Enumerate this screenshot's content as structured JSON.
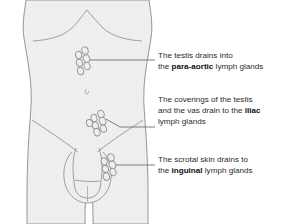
{
  "figure": {
    "colors": {
      "background": "#ffffff",
      "skin_fill": "#f0f0f0",
      "outline": "#8a8a8a",
      "node_outline": "#9a9a9a",
      "node_fill": "#efefef",
      "leader_line": "#6e6e6e",
      "text": "#2b2b2b",
      "text_bold": "#111111"
    }
  },
  "callouts": [
    {
      "id": "para-aortic",
      "target": "para-aortic-node-cluster",
      "lines": [
        {
          "text": "The testis drains into",
          "bold": ""
        },
        {
          "pre": "the ",
          "bold": "para-aortic",
          "post": " lymph glands"
        }
      ]
    },
    {
      "id": "iliac",
      "target": "iliac-node-cluster",
      "lines": [
        {
          "text": "The coverings of the testis",
          "bold": ""
        },
        {
          "pre": "and the vas drain to the ",
          "bold": "iliac",
          "post": ""
        },
        {
          "text": "lymph glands",
          "bold": ""
        }
      ]
    },
    {
      "id": "inguinal",
      "target": "inguinal-node-cluster",
      "lines": [
        {
          "text": "The scrotal skin drains to",
          "bold": ""
        },
        {
          "pre": "the ",
          "bold": "inguinal",
          "post": " lymph glands"
        }
      ]
    }
  ],
  "node_clusters": [
    {
      "name": "para-aortic-node-cluster",
      "label": "para-aortic lymph glands",
      "count": 6,
      "nodes": [
        {
          "cx": 85.0,
          "cy": 50.5,
          "rx": 3.1,
          "ry": 3.8,
          "rot": -18
        },
        {
          "cx": 78.6,
          "cy": 55.0,
          "rx": 3.0,
          "ry": 3.7,
          "rot": -12
        },
        {
          "cx": 86.4,
          "cy": 58.6,
          "rx": 3.2,
          "ry": 3.9,
          "rot": -20
        },
        {
          "cx": 79.4,
          "cy": 62.8,
          "rx": 3.0,
          "ry": 3.6,
          "rot": -15
        },
        {
          "cx": 87.0,
          "cy": 66.0,
          "rx": 3.0,
          "ry": 3.7,
          "rot": -22
        },
        {
          "cx": 80.6,
          "cy": 71.0,
          "rx": 3.1,
          "ry": 3.8,
          "rot": -14
        }
      ]
    },
    {
      "name": "iliac-node-cluster",
      "label": "iliac lymph glands",
      "count": 7,
      "nodes": [
        {
          "cx": 101.0,
          "cy": 114.0,
          "rx": 3.1,
          "ry": 3.8,
          "rot": -20
        },
        {
          "cx": 94.0,
          "cy": 118.0,
          "rx": 3.0,
          "ry": 3.7,
          "rot": -14
        },
        {
          "cx": 102.6,
          "cy": 121.2,
          "rx": 3.2,
          "ry": 3.9,
          "rot": -24
        },
        {
          "cx": 95.4,
          "cy": 125.6,
          "rx": 3.0,
          "ry": 3.6,
          "rot": -16
        },
        {
          "cx": 103.4,
          "cy": 128.6,
          "rx": 3.0,
          "ry": 3.7,
          "rot": -20
        },
        {
          "cx": 89.4,
          "cy": 123.0,
          "rx": 3.0,
          "ry": 3.6,
          "rot": -12
        },
        {
          "cx": 97.0,
          "cy": 132.2,
          "rx": 3.1,
          "ry": 3.8,
          "rot": -18
        }
      ]
    },
    {
      "name": "inguinal-node-cluster",
      "label": "inguinal lymph glands",
      "count": 6,
      "nodes": [
        {
          "cx": 111.0,
          "cy": 157.6,
          "rx": 3.1,
          "ry": 3.8,
          "rot": -20
        },
        {
          "cx": 104.2,
          "cy": 161.4,
          "rx": 3.0,
          "ry": 3.7,
          "rot": -14
        },
        {
          "cx": 112.4,
          "cy": 164.8,
          "rx": 3.2,
          "ry": 3.9,
          "rot": -22
        },
        {
          "cx": 105.4,
          "cy": 169.0,
          "rx": 3.0,
          "ry": 3.6,
          "rot": -16
        },
        {
          "cx": 113.0,
          "cy": 172.0,
          "rx": 3.0,
          "ry": 3.7,
          "rot": -20
        },
        {
          "cx": 106.4,
          "cy": 176.6,
          "rx": 3.1,
          "ry": 3.8,
          "rot": -14
        }
      ]
    }
  ],
  "leader_lines": [
    {
      "name": "leader-para-aortic",
      "d": "M 90 60 L 155 60"
    },
    {
      "name": "leader-iliac",
      "d": "M 106 119 L 120 127 L 155 127"
    },
    {
      "name": "leader-inguinal",
      "d": "M 116 165 L 155 165"
    }
  ],
  "anatomy_paths": [
    {
      "name": "body-outline",
      "d": "M 26 0 C 24 14 22 26 24 38 C 26 52 30 70 31 88 C 32 104 30 118 29 134 C 28 152 27 172 27 192 C 27 206 27 216 27 224 L 85 224 C 85 214 85 204 86 196 C 87 188 88 182 88 176 C 88 172 88 168 88 164 L 90 164 C 90 168 90 172 90 176 C 90 182 91 188 92 196 C 93 204 93 214 93 224 L 148 224 C 148 216 148 206 148 192 C 148 172 147 152 146 134 C 145 118 143 104 144 88 C 145 70 149 52 151 38 C 153 26 151 14 149 0 Z"
    },
    {
      "name": "ribcage-arch",
      "d": "M 33 41 C 48 40 62 37 72 28 C 78 22 82 16 87 10 C 92 16 97 22 103 28 C 113 37 127 40 142 41"
    },
    {
      "name": "navel",
      "d": "M 86.4 89 C 85.4 89.6 85.0 91.0 85.4 92.4 C 85.8 93.6 86.8 94.2 87.6 93.8 C 88.4 93.4 88.6 92.2 88.2 91.0"
    },
    {
      "name": "inguinal-crease-left",
      "d": "M 32 120 C 44 128 58 137 70 146 C 74 149 78 152 81 155"
    },
    {
      "name": "inguinal-crease-right",
      "d": "M 143 120 C 131 128 117 137 105 146 C 101 149 97 152 94 155"
    },
    {
      "name": "penis-shaft-left",
      "d": "M 76 148 C 74 154 73 160 73 168 C 73 176 74 182 75 188"
    },
    {
      "name": "penis-shaft-right",
      "d": "M 99 148 C 101 154 102 160 102 168 C 102 176 101 182 100 188"
    },
    {
      "name": "glans-ridge",
      "d": "M 75 180 C 80 181 86 181.5 92 181.5 C 96 181.5 99 181.2 100 181"
    },
    {
      "name": "glans-tip",
      "d": "M 75 188 C 76 194 81 198 87.5 198 C 94 198 99 194 100 188"
    },
    {
      "name": "scrotum-outline",
      "d": "M 72 152 C 66 158 63 168 64 178 C 65 190 72 199 81 202 C 85 203.4 90 203.4 94 202 C 103 199 110 190 111 178 C 112 168 109 158 103 152"
    },
    {
      "name": "scrotum-midline",
      "d": "M 87.5 186 C 87.5 192 87.5 197 87.5 202"
    }
  ]
}
